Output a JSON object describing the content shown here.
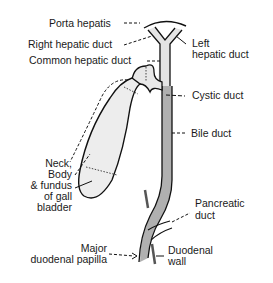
{
  "diagram": {
    "colors": {
      "outline": "#111111",
      "duct_fill_light": "#e4e4e4",
      "duct_fill_dark": "#b0b0b0",
      "gallbladder_fill": "#ededed",
      "wall": "#555555"
    },
    "labels": {
      "porta_hepatis": "Porta hepatis",
      "right_hepatic_duct": "Right hepatic duct",
      "common_hepatic_duct": "Common hepatic duct",
      "left_hepatic_duct_1": "Left",
      "left_hepatic_duct_2": "hepatic duct",
      "cystic_duct": "Cystic duct",
      "bile_duct": "Bile duct",
      "gallbladder_1": "Neck,",
      "gallbladder_2": "Body",
      "gallbladder_3": "& fundus",
      "gallbladder_4": "of gall",
      "gallbladder_5": "bladder",
      "pancreatic_duct_1": "Pancreatic",
      "pancreatic_duct_2": "duct",
      "major_papilla_1": "Major",
      "major_papilla_2": "duodenal papilla",
      "duodenal_wall_1": "Duodenal",
      "duodenal_wall_2": "wall"
    }
  }
}
